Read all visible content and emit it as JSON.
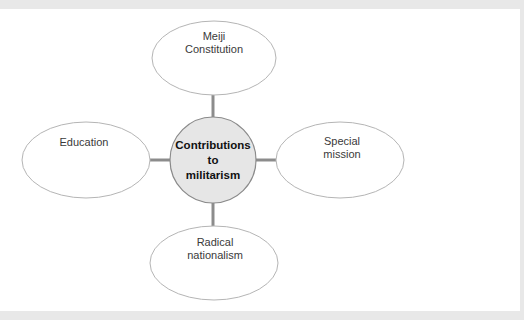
{
  "diagram": {
    "type": "spider-diagram",
    "center": {
      "label_lines": [
        "Contributions",
        "to",
        "militarism"
      ],
      "fill": "#e6e6e6",
      "stroke": "#8a8a8a"
    },
    "nodes": [
      {
        "id": "top",
        "label_lines": [
          "Meiji",
          "Constitution"
        ]
      },
      {
        "id": "left",
        "label_lines": [
          "Education"
        ]
      },
      {
        "id": "right",
        "label_lines": [
          "Special",
          "mission"
        ]
      },
      {
        "id": "bottom",
        "label_lines": [
          "Radical",
          "nationalism"
        ]
      }
    ],
    "connector_color": "#8c8c8c",
    "ellipse_stroke": "#b5b5b5"
  }
}
